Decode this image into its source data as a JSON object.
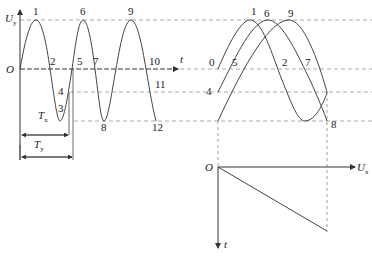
{
  "left_plot": {
    "y_axis_label": "U",
    "y_axis_sub": "y",
    "origin_label": "O",
    "x_axis_label": "t",
    "point_labels": [
      "1",
      "2",
      "3",
      "4",
      "5",
      "6",
      "7",
      "8",
      "9",
      "10",
      "11",
      "12"
    ],
    "period_label_x": "T",
    "period_label_x_sub": "x",
    "period_label_y": "T",
    "period_label_y_sub": "y"
  },
  "right_plot": {
    "point_labels": [
      "0",
      "1",
      "2",
      "4",
      "5",
      "6",
      "7",
      "8",
      "9"
    ],
    "origin_label": "O",
    "x_axis_label": "U",
    "x_axis_sub": "x",
    "t_axis_label": "t"
  },
  "colors": {
    "stroke": "#444444",
    "dash": "#777777"
  }
}
